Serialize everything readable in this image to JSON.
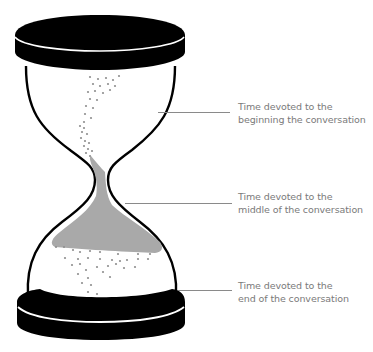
{
  "diagram": {
    "colors": {
      "frame": "#000000",
      "sand": "#a9a9a9",
      "grains": "#8f8f8f",
      "label_text": "#7a7a7a",
      "connector": "#8a8a8a"
    },
    "labels": [
      {
        "line1": "Time devoted to the",
        "line2": "beginning the conversation"
      },
      {
        "line1": "Time devoted to the",
        "line2": "middle of the conversation"
      },
      {
        "line1": "Time devoted to the",
        "line2": "end of the conversation"
      }
    ]
  }
}
